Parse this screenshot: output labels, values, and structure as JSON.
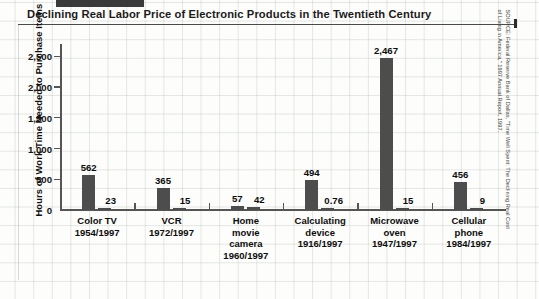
{
  "title": "Declining Real Labor Price of Electronic Products in the Twentieth Century",
  "source": {
    "line1": "SOURCE: Federal Reserve Bank of Dallas, \"Time Well Spent: The Declining Real Cost",
    "line2": "of Living in America,\" 1997 Annual Report, 1997."
  },
  "chart_data": {
    "type": "bar",
    "title": "Declining Real Labor Price of Electronic Products in the Twentieth Century",
    "xlabel": "",
    "ylabel": "Hours of Work Time Needed to Purchase Items",
    "ylim": [
      0,
      2700
    ],
    "yticks": [
      0,
      500,
      1000,
      1500,
      2000,
      2500
    ],
    "ytick_labels": [
      "0",
      "500",
      "1,000",
      "1,500",
      "2,000",
      "2,500"
    ],
    "grid": false,
    "legend": "none",
    "categories": [
      "Color TV 1954/1997",
      "VCR 1972/1997",
      "Home movie camera 1960/1997",
      "Calculating device 1916/1997",
      "Microwave oven 1947/1997",
      "Cellular phone 1984/1997"
    ],
    "category_lines": [
      [
        "Color TV",
        "1954/1997"
      ],
      [
        "VCR",
        "1972/1997"
      ],
      [
        "Home",
        "movie",
        "camera",
        "1960/1997"
      ],
      [
        "Calculating",
        "device",
        "1916/1997"
      ],
      [
        "Microwave",
        "oven",
        "1947/1997"
      ],
      [
        "Cellular",
        "phone",
        "1984/1997"
      ]
    ],
    "series": [
      {
        "name": "Earlier year",
        "values": [
          562,
          365,
          57,
          494,
          2467,
          456
        ],
        "labels": [
          "562",
          "365",
          "57",
          "494",
          "2,467",
          "456"
        ]
      },
      {
        "name": "1997",
        "values": [
          23,
          15,
          42,
          0.76,
          15,
          9
        ],
        "labels": [
          "23",
          "15",
          "42",
          "0.76",
          "15",
          "9"
        ]
      }
    ],
    "bar_color": "#4d4d4d"
  }
}
